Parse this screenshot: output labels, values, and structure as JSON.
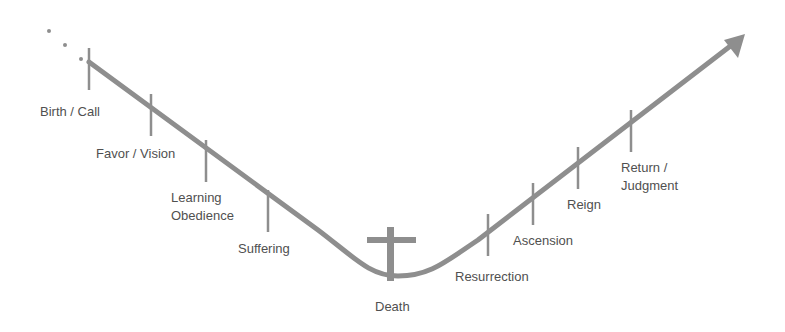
{
  "diagram": {
    "type": "timeline-curve",
    "colors": {
      "line": "#8e8e8e",
      "text": "#505050",
      "background": "#ffffff"
    },
    "stages": [
      {
        "id": "birth",
        "label": "Birth / Call"
      },
      {
        "id": "favor",
        "label": "Favor / Vision"
      },
      {
        "id": "learning",
        "line1": "Learning",
        "line2": "Obedience"
      },
      {
        "id": "suffering",
        "label": "Suffering"
      },
      {
        "id": "death",
        "label": "Death",
        "icon": "cross-icon"
      },
      {
        "id": "resurrection",
        "label": "Resurrection"
      },
      {
        "id": "ascension",
        "label": "Ascension"
      },
      {
        "id": "reign",
        "label": "Reign"
      },
      {
        "id": "return",
        "line1": "Return /",
        "line2": "Judgment"
      }
    ],
    "start_marker": "ellipsis-dots",
    "end_marker": "arrow-head"
  }
}
